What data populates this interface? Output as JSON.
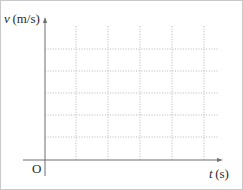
{
  "figure": {
    "kind": "blank-grid-plot",
    "background_color": "#ffffff",
    "border_color": "#c9c9c9",
    "axis_color": "#6f6f6f",
    "grid_color": "#b0b0b0",
    "text_color": "#2b2b2b"
  },
  "labels": {
    "y_axis_variable": "v",
    "y_axis_unit": "(m/s)",
    "x_axis_variable": "t",
    "x_axis_unit": "(s)",
    "origin": "O"
  },
  "chart_data": {
    "type": "line",
    "title": "",
    "subtitle": "",
    "xlabel": "t (s)",
    "ylabel": "v (m/s)",
    "x": [],
    "series": [],
    "values": [],
    "categories": [],
    "xlim": [
      0,
      6
    ],
    "ylim": [
      0,
      6
    ],
    "xticks": [],
    "yticks": [],
    "xticklabels": [],
    "yticklabels": [],
    "grid": true,
    "grid_style": "dotted",
    "grid_vertical_count": 5,
    "grid_horizontal_count": 5,
    "legend": false,
    "legend_position": "none",
    "annotations": [],
    "note": "Empty velocity-time axes with a dotted grid; no data plotted."
  },
  "geometry": {
    "width": 243,
    "height": 190,
    "y_axis_x": 44,
    "y_axis_top": 16,
    "y_axis_bottom": 175,
    "x_axis_y": 159,
    "x_axis_left": 22,
    "x_axis_right": 222,
    "grid_vertical_x": [
      75,
      107,
      139,
      171,
      203
    ],
    "grid_vertical_top": 25,
    "grid_vertical_bottom": 159,
    "grid_horizontal_y": [
      48,
      70,
      92,
      114,
      136
    ],
    "grid_horizontal_left": 44,
    "grid_horizontal_right": 218
  }
}
